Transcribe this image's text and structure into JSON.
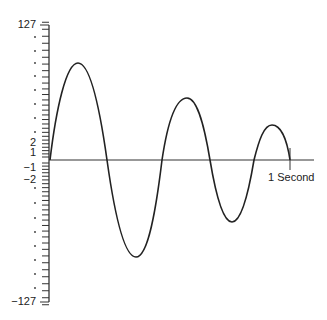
{
  "chart_data": {
    "type": "line",
    "title": "",
    "xlabel": "1 Second",
    "ylabel": "",
    "ylim": [
      -127,
      127
    ],
    "y_scale": "companded (mu-law style), ticks denser near zero",
    "grid": false,
    "legend": null,
    "y_tick_labels": [
      "127",
      "2",
      "1",
      "-1",
      "-2",
      "-127"
    ],
    "x_marker_label": "1 Second",
    "series": [
      {
        "name": "waveform",
        "points": [
          {
            "t": 0.0,
            "y": 0
          },
          {
            "t": 0.11,
            "y": 110
          },
          {
            "t": 0.24,
            "y": 0
          },
          {
            "t": 0.36,
            "y": -110
          },
          {
            "t": 0.47,
            "y": 0
          },
          {
            "t": 0.57,
            "y": 70
          },
          {
            "t": 0.67,
            "y": 0
          },
          {
            "t": 0.76,
            "y": -70
          },
          {
            "t": 0.85,
            "y": 0
          },
          {
            "t": 0.92,
            "y": 38
          },
          {
            "t": 1.0,
            "y": 0
          }
        ]
      }
    ]
  },
  "labels": {
    "y_top": "127",
    "y_p2": "2",
    "y_p1": "1",
    "y_m1": "−1",
    "y_m2": "−2",
    "y_bottom": "−127",
    "x_end": "1 Second"
  },
  "colors": {
    "line": "#222222",
    "axis": "#333333",
    "background": "#ffffff"
  }
}
